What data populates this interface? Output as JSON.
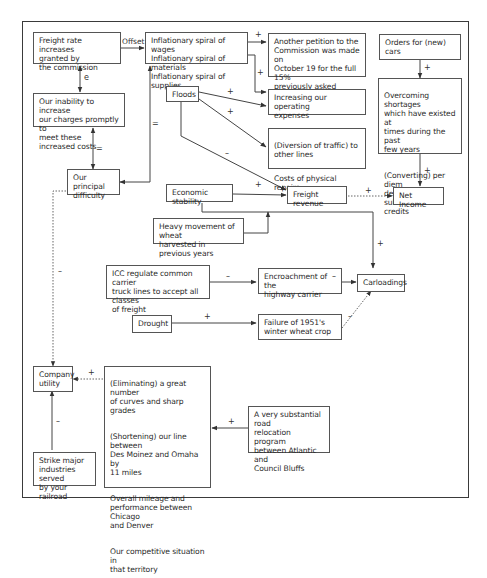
{
  "diagram": {
    "type": "causal-loop-diagram",
    "nodes": {
      "freight_rate_increases": "Freight rate increases\ngranted by\nthe commission",
      "inflationary_spiral": "Inflationary spiral of wages\nInflationary spiral of materials\nInflationary spiral of supplies",
      "another_petition": "Another petition to the\nCommission was made on\nOctober 19 for the full 15%\npreviously asked",
      "orders_new_cars": "Orders for (new)\ncars",
      "inability_increase": "Our inability to increase\nour charges promptly to\nmeet these increased costs",
      "floods": "Floods",
      "increasing_expenses": "Increasing our operating\nexpenses",
      "overcoming_shortages_p1": "Overcoming shortages\nwhich have existed at\ntimes during the past\nfew years",
      "overcoming_shortages_p2": "(Converting) per diem\ndebits into substantial\ncredits",
      "diversion_p1": "(Diversion of traffic) to\nother lines",
      "diversion_p2": "Costs of physical repairs",
      "principal_difficulty": "Our principal\ndifficulty",
      "economic_stability": "Economic stability",
      "freight_revenue": "Freight revenue",
      "net_income": "Net Income",
      "heavy_wheat": "Heavy movement of wheat\nharvested in previous years",
      "icc_regulate": "ICC regulate common carrier\ntruck lines to accept all classes\nof freight",
      "encroachment": "Encroachment of the\nhighway carrier",
      "carloadings": "Carloadings",
      "drought": "Drought",
      "failure_wheat": "Failure of 1951's\nwinter wheat crop",
      "company_utility": "Company\nutility",
      "eliminating_p1": "(Eliminating) a great number\nof curves and sharp grades",
      "eliminating_p2": "(Shortening) our line between\nDes Moinez and Omaha by\n11 miles",
      "eliminating_p3": "Overall mileage and\nperformance between Chicago\nand Denver",
      "eliminating_p4": "Our competitive situation in\nthat territory",
      "road_relocation": "A very substantial road\nrelocation program\nbetween Atlantic and\nCouncil Bluffs",
      "strike": "Strike major\nindustries served\nby your railroad"
    },
    "edge_labels": {
      "offset": "Offset",
      "e": "e",
      "eq1": "=",
      "eq2": "=",
      "infl_petition": "+",
      "infl_expenses": "+",
      "orders_shortages": "+",
      "floods_expenses": "+",
      "floods_diversion": "+",
      "floods_revenue": "–",
      "shortages_income": "+",
      "econ_revenue": "+",
      "revenue_income": "+",
      "heavy_carload": "+",
      "icc_encroach": "–",
      "encroach_carload": "–",
      "drought_failure": "+",
      "failure_carload": "–",
      "difficulty_utility": "–",
      "elim_utility": "+",
      "road_elim": "+",
      "strike_utility": "–"
    },
    "colors": {
      "line": "#444444",
      "box_border": "#555555",
      "text": "#2a2a2a"
    }
  }
}
